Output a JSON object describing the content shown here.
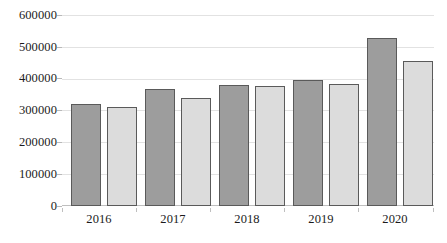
{
  "chart_data": {
    "type": "bar",
    "title": "",
    "subtitle": "",
    "xlabel": "",
    "ylabel": "",
    "categories": [
      "2016",
      "2017",
      "2018",
      "2019",
      "2020"
    ],
    "series": [
      {
        "name": "Series 1",
        "color": "#9d9d9d",
        "values": [
          323000,
          371000,
          381000,
          397000,
          531000
        ]
      },
      {
        "name": "Series 2",
        "color": "#dcdcdc",
        "values": [
          314000,
          340000,
          379000,
          384000,
          459000
        ]
      }
    ],
    "ylim": [
      0,
      600000
    ],
    "ytick_values": [
      0,
      100000,
      200000,
      300000,
      400000,
      500000,
      600000
    ],
    "ytick_labels": [
      "0",
      "100000",
      "200000",
      "300000",
      "400000",
      "500000",
      "600000"
    ],
    "grid": true,
    "grid_axis": "y",
    "legend": false,
    "legend_position": "none",
    "bar_outline_color": "#5a5a5a",
    "background_color": "#ffffff",
    "gridline_color": "#e2e2e2",
    "axis_text_color": "#1b1b1b"
  }
}
